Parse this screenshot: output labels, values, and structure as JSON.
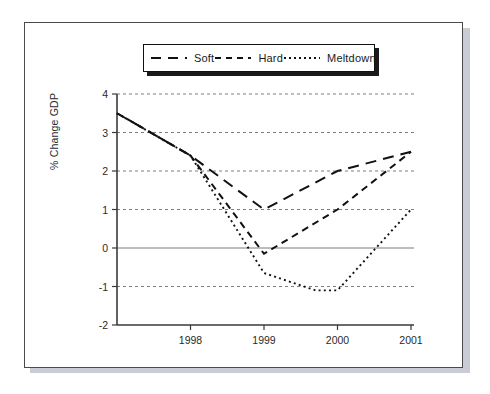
{
  "chart_data": {
    "type": "line",
    "title": "",
    "xlabel": "",
    "ylabel": "% Change GDP",
    "xlim": [
      1997.0,
      2001.0
    ],
    "ylim": [
      -2,
      4
    ],
    "yticks": [
      -2,
      -1,
      0,
      1,
      2,
      3,
      4
    ],
    "xticks": [
      1998,
      1999,
      2000,
      2001
    ],
    "xtick_labels": [
      "1998",
      "1999",
      "2000",
      "2001"
    ],
    "ytick_labels": [
      "-2",
      "-1",
      "0",
      "1",
      "2",
      "3",
      "4"
    ],
    "grid": "horizontal-dashed",
    "zero_line": true,
    "legend_position": "top-center",
    "series": [
      {
        "name": "Soft",
        "dash": "long-dash",
        "x": [
          1997.0,
          1998.0,
          1999.0,
          2000.0,
          2001.0
        ],
        "values": [
          3.5,
          2.4,
          1.0,
          2.0,
          2.5
        ]
      },
      {
        "name": "Hard",
        "dash": "medium-dash",
        "x": [
          1997.0,
          1998.0,
          1999.0,
          2000.0,
          2001.0
        ],
        "values": [
          3.5,
          2.4,
          -0.15,
          1.0,
          2.5
        ]
      },
      {
        "name": "Meltdown",
        "dash": "dotted",
        "x": [
          1997.0,
          1998.0,
          1999.0,
          1999.7,
          2000.0,
          2001.0
        ],
        "values": [
          3.5,
          2.4,
          -0.65,
          -1.1,
          -1.1,
          1.0
        ]
      }
    ]
  },
  "legend": {
    "entries": [
      {
        "label": "Soft"
      },
      {
        "label": "Hard"
      },
      {
        "label": "Meltdown"
      }
    ]
  },
  "axes": {
    "y_title": "% Change GDP"
  }
}
